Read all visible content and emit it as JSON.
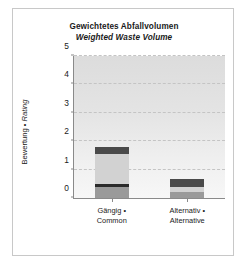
{
  "chart_data": {
    "type": "bar",
    "stacked": true,
    "title": "Gewichtetes Abfallvolumen",
    "subtitle": "Weighted Waste Volume",
    "xlabel": "",
    "ylabel_primary": "Bewertung • ",
    "ylabel_italic": "Rating",
    "ylim": [
      0,
      5
    ],
    "yticks": [
      0,
      1,
      2,
      3,
      4,
      5
    ],
    "ytick_labels": [
      "0",
      "1",
      "2",
      "3",
      "4",
      "5"
    ],
    "grid": true,
    "grid_axis": "y",
    "legend": "none",
    "categories": [
      "Gängig •\nCommon",
      "Alternativ •\nAlternative"
    ],
    "category_labels": [
      {
        "line1": "Gängig •",
        "line2": "Common"
      },
      {
        "line1": "Alternativ •",
        "line2": "Alternative"
      }
    ],
    "series": [
      {
        "name": "segment-1",
        "color": "#9a9a9a",
        "values": [
          0.4,
          0.22
        ]
      },
      {
        "name": "segment-2",
        "color": "#2b2b2b",
        "values": [
          0.1,
          0.16
        ]
      },
      {
        "name": "segment-3",
        "color": "#d2d2d2",
        "values": [
          1.05,
          0.0
        ]
      },
      {
        "name": "segment-4",
        "color": "#4a4a4a",
        "values": [
          0.25,
          0.29
        ]
      }
    ],
    "totals": [
      1.8,
      0.67
    ],
    "bars": [
      {
        "category_line1": "Gängig •",
        "category_line2": "Common",
        "total": 1.8,
        "segments": [
          {
            "from": 0.0,
            "to": 0.4,
            "value": 0.4,
            "color": "#9a9a9a"
          },
          {
            "from": 0.4,
            "to": 0.5,
            "value": 0.1,
            "color": "#2b2b2b"
          },
          {
            "from": 0.5,
            "to": 1.55,
            "value": 1.05,
            "color": "#d2d2d2"
          },
          {
            "from": 1.55,
            "to": 1.8,
            "value": 0.25,
            "color": "#4a4a4a"
          }
        ]
      },
      {
        "category_line1": "Alternativ •",
        "category_line2": "Alternative",
        "total": 0.67,
        "segments": [
          {
            "from": 0.0,
            "to": 0.22,
            "value": 0.22,
            "color": "#9a9a9a"
          },
          {
            "from": 0.22,
            "to": 0.38,
            "value": 0.16,
            "color": "#d2d2d2"
          },
          {
            "from": 0.38,
            "to": 0.67,
            "value": 0.29,
            "color": "#4a4a4a"
          }
        ]
      }
    ],
    "colors": {
      "plot_background_top": "#dcdcdc",
      "plot_background_bottom": "#f7f7f7",
      "axis": "#8a8a8a",
      "gridline": "#c4c4c4",
      "text": "#1a1a1a",
      "figure_border": "#c8c8c8",
      "figure_background": "#ffffff"
    }
  }
}
